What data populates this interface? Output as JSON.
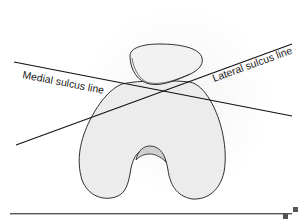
{
  "diagram": {
    "labels": {
      "medial": "Medial sulcus line",
      "lateral": "Lateral sulcus line"
    },
    "colors": {
      "bone_fill": "#ececec",
      "outline": "#1a1a1a",
      "background_circle": "#f6f6f6",
      "footer_rule": "#555555",
      "footer_mark": "#555555"
    }
  }
}
